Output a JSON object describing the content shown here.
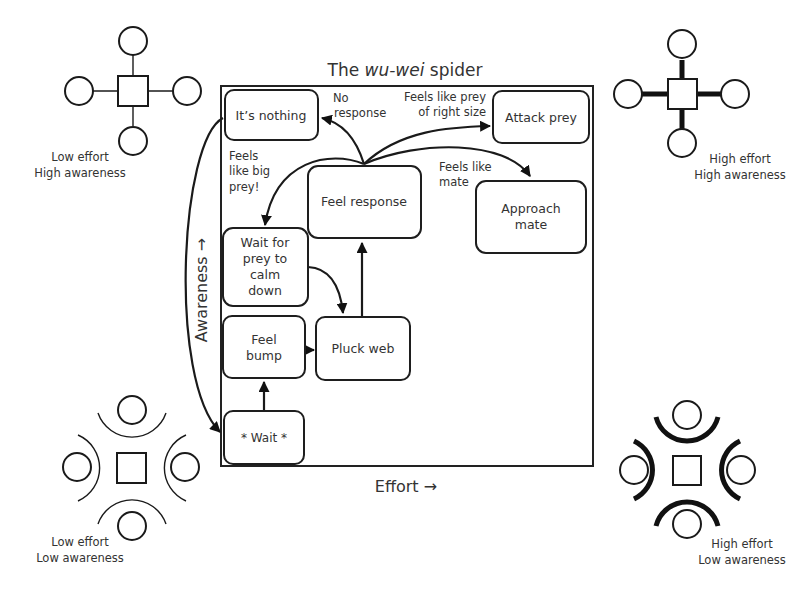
{
  "title": {
    "prefix": "The ",
    "italic": "wu-wei",
    "suffix": " spider"
  },
  "axes": {
    "x_label": "Effort →",
    "y_label": "Awareness →"
  },
  "nodes": {
    "its_nothing": {
      "lines": [
        "It’s nothing"
      ]
    },
    "attack_prey": {
      "lines": [
        "Attack prey"
      ]
    },
    "feel_response": {
      "lines": [
        "Feel response"
      ]
    },
    "approach_mate": {
      "lines": [
        "Approach",
        "mate"
      ]
    },
    "wait_for_prey": {
      "lines": [
        "Wait for",
        "prey to",
        "calm",
        "down"
      ]
    },
    "feel_bump": {
      "lines": [
        "Feel",
        "bump"
      ]
    },
    "pluck_web": {
      "lines": [
        "Pluck web"
      ]
    },
    "wait": {
      "lines": [
        "* Wait *"
      ]
    }
  },
  "edge_labels": {
    "no_response": [
      "No",
      "response"
    ],
    "right_size": [
      "Feels like prey",
      "of right size"
    ],
    "big_prey": [
      "Feels",
      "like big",
      "prey!"
    ],
    "mate": [
      "Feels like",
      "mate"
    ]
  },
  "quadrants": {
    "top_left": [
      "Low effort",
      "High awareness"
    ],
    "top_right": [
      "High effort",
      "High awareness"
    ],
    "bottom_left": [
      "Low effort",
      "Low awareness"
    ],
    "bottom_right": [
      "High effort",
      "Low awareness"
    ]
  }
}
